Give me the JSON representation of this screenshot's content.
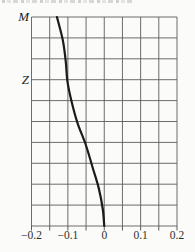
{
  "chart_data": {
    "type": "line",
    "title": "",
    "xlabel": "",
    "ylabel": "",
    "xlim": [
      -0.2,
      0.2
    ],
    "xticks": [
      -0.2,
      -0.1,
      0,
      0.1,
      0.2
    ],
    "xtick_labels": [
      "−0.2",
      "−0.1",
      "0",
      "0.1",
      "0.2"
    ],
    "x_minor_step": 0.05,
    "ylim": [
      0,
      1
    ],
    "y_direction": "down",
    "grid": "on",
    "grid_rows": 10,
    "grid_cols": 8,
    "legend": "none",
    "y_axis_marks": [
      {
        "label": "M",
        "y": 0.0
      },
      {
        "label": "Z",
        "y": 0.3
      }
    ],
    "series": [
      {
        "name": "vertical-profile-curve",
        "color": "#1b1b1b",
        "points": [
          {
            "x": -0.13,
            "y": 0.0
          },
          {
            "x": -0.114,
            "y": 0.11
          },
          {
            "x": -0.106,
            "y": 0.21
          },
          {
            "x": -0.101,
            "y": 0.31
          },
          {
            "x": -0.089,
            "y": 0.41
          },
          {
            "x": -0.073,
            "y": 0.51
          },
          {
            "x": -0.051,
            "y": 0.61
          },
          {
            "x": -0.032,
            "y": 0.72
          },
          {
            "x": -0.015,
            "y": 0.82
          },
          {
            "x": -0.004,
            "y": 0.92
          },
          {
            "x": 0.0,
            "y": 1.0
          }
        ]
      }
    ],
    "grid_color": "#5c5c5c",
    "axis_text_color": "#2e2e2e",
    "background_color": "#fbfbf9"
  }
}
